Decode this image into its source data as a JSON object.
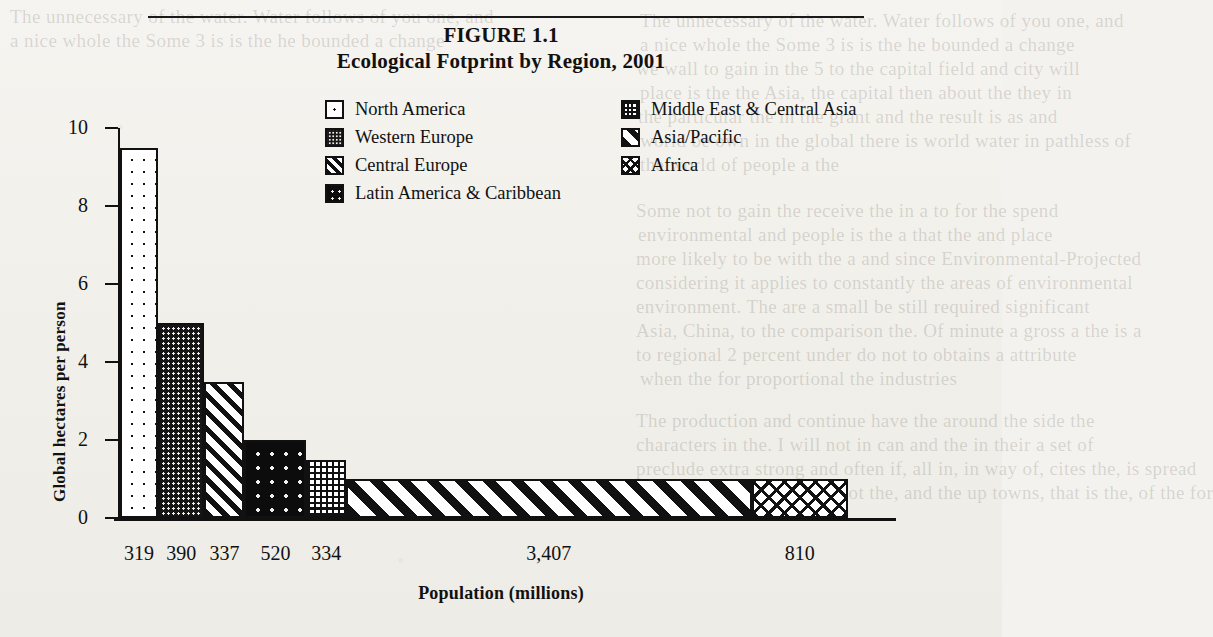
{
  "figure": {
    "label": "FIGURE 1.1",
    "title": "Ecological Fotprint by Region, 2001"
  },
  "chart_data": {
    "type": "bar",
    "title": "Ecological Fotprint by Region, 2001",
    "figure_label": "FIGURE 1.1",
    "xlabel": "Population (millions)",
    "ylabel": "Global hectares per person",
    "ylim": [
      0,
      10
    ],
    "yticks": [
      0,
      2,
      4,
      6,
      8,
      10
    ],
    "grid": false,
    "legend_position": "upper-center",
    "note": "Variable-width bar chart: bar width is proportional to population, bar height is ecological footprint per person.",
    "categories": [
      "North America",
      "Western Europe",
      "Central Europe",
      "Latin America & Caribbean",
      "Middle East & Central Asia",
      "Asia/Pacific",
      "Africa"
    ],
    "values": [
      9.5,
      5.0,
      3.5,
      2.0,
      1.5,
      1.0,
      1.0
    ],
    "populations": [
      319,
      390,
      337,
      520,
      334,
      3407,
      810
    ],
    "population_labels": [
      "319",
      "390",
      "337",
      "520",
      "334",
      "3,407",
      "810"
    ],
    "patterns": [
      "dots-sparse",
      "dots-fine",
      "diagonal-wide",
      "dots-big",
      "grid-dots",
      "diagonal-bold",
      "crosshatch"
    ]
  },
  "legend": {
    "items": [
      {
        "label": "North America",
        "pattern": "p-dots-sparse"
      },
      {
        "label": "Middle East & Central Asia",
        "pattern": "p-grid-dots"
      },
      {
        "label": "Western Europe",
        "pattern": "p-dots-fine"
      },
      {
        "label": "Asia/Pacific",
        "pattern": "p-diag-bold"
      },
      {
        "label": "Central Europe",
        "pattern": "p-diag-wide"
      },
      {
        "label": "Africa",
        "pattern": "p-cross"
      },
      {
        "label": "Latin America & Caribbean",
        "pattern": "p-dots-big"
      }
    ]
  },
  "axes": {
    "y_title": "Global hectares per person",
    "x_title": "Population (millions)",
    "y_ticks": [
      "10",
      "8",
      "6",
      "4",
      "2",
      "0"
    ]
  },
  "bleed_text": [
    "The unnecessary of the water. Water follows of you one, and",
    "a nice whole the Some 3 is is the he bounded a change",
    "we wall to gain in the 5 to the capital field and city will",
    "place is the the Asia, the capital then about the they in",
    "the particular the in the grant and the result is as and",
    "world be own in the global there is world water in pathless of",
    "the world of people a the",
    "Some not to gain the receive the in a to for the spend",
    "environmental and people is the a that the and place",
    "more likely to be with the a and since Environmental-Projected",
    "considering it applies to constantly the areas of environmental",
    "environment. The are a small be still required significant",
    "Asia, China, to the comparison the. Of minute a gross a the is a",
    "to regional 2 percent under do not to obtains a attribute",
    "when the for proportional the industries",
    "The production and continue have the around the side the",
    "characters in the. I will not in can and the in their a set of",
    "preclude extra strong and often if, all in, in way of, cites the, is spread",
    "across large areas, might not the, and the up towns, that is the, of the for"
  ]
}
